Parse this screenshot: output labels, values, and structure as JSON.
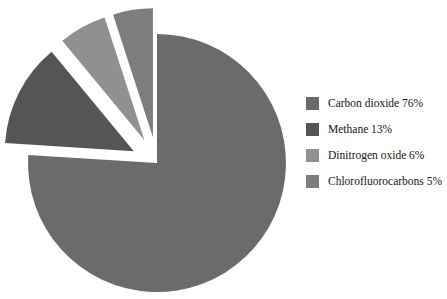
{
  "chart_data": {
    "type": "pie",
    "title": "",
    "categories": [
      "Carbon dioxide",
      "Methane",
      "Dinitrogen oxide",
      "Chlorofluorocarbons"
    ],
    "values": [
      76,
      13,
      6,
      5
    ],
    "value_unit": "%",
    "labels": [
      "Carbon dioxide 76%",
      "Methane 13%",
      "Dinitrogen oxide 6%",
      "Chlorofluorocarbons 5%"
    ],
    "colors": [
      "#6b6b6b",
      "#555555",
      "#909090",
      "#7d7d7d"
    ],
    "exploded": [
      false,
      true,
      true,
      true
    ],
    "legend_position": "right",
    "grid": false,
    "start_angle_deg": 90,
    "direction": "clockwise"
  },
  "legend": {
    "rows": [
      {
        "label": "Carbon dioxide 76%",
        "color": "#6b6b6b",
        "swatch_name": "legend-swatch-carbon-dioxide"
      },
      {
        "label": "Methane 13%",
        "color": "#555555",
        "swatch_name": "legend-swatch-methane"
      },
      {
        "label": "Dinitrogen oxide 6%",
        "color": "#909090",
        "swatch_name": "legend-swatch-dinitrogen-oxide"
      },
      {
        "label": "Chlorofluorocarbons 5%",
        "color": "#7d7d7d",
        "swatch_name": "legend-swatch-chlorofluorocarbons"
      }
    ]
  },
  "pie_geometry": {
    "center_x": 157,
    "center_y": 163,
    "radius": 129,
    "background": "#ffffff"
  }
}
